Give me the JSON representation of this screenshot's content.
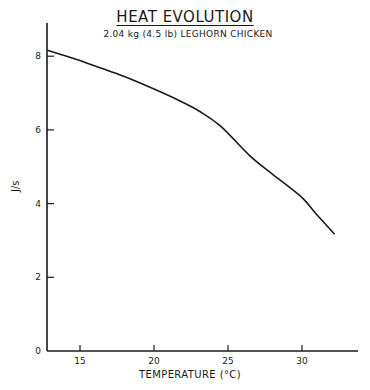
{
  "chart_data": {
    "type": "line",
    "title": "HEAT EVOLUTION",
    "subtitle": "2.04 kg (4.5 lb) LEGHORN CHICKEN",
    "xlabel": "TEMPERATURE (°C)",
    "ylabel": "J/s",
    "xlim": [
      12.8,
      33.8
    ],
    "ylim": [
      0,
      8.9
    ],
    "xticks": [
      15,
      20,
      25,
      30
    ],
    "yticks": [
      0,
      2,
      4,
      6,
      8
    ],
    "grid": false,
    "legend": null,
    "series": [
      {
        "name": "Heat evolution",
        "x": [
          12.8,
          13.6,
          15,
          16.4,
          18,
          20,
          21.8,
          23.1,
          24.5,
          26.5,
          28,
          29.9,
          31,
          32.2
        ],
        "y": [
          8.16,
          8.06,
          7.88,
          7.68,
          7.45,
          7.11,
          6.78,
          6.5,
          6.1,
          5.29,
          4.8,
          4.2,
          3.7,
          3.17
        ]
      }
    ]
  },
  "labels": {
    "title": "HEAT EVOLUTION",
    "subtitle": "2.04 kg (4.5 lb) LEGHORN CHICKEN",
    "xlabel": "TEMPERATURE   (°C)",
    "ylabel": "J/s",
    "xticks": [
      "15",
      "20",
      "25",
      "30"
    ],
    "yticks": [
      "0",
      "2",
      "4",
      "6",
      "8"
    ]
  }
}
